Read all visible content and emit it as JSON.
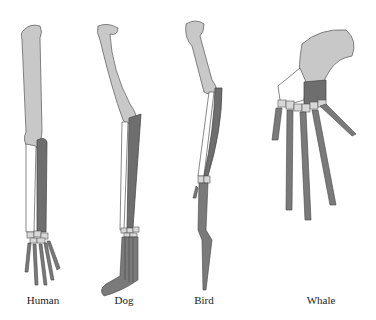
{
  "figure": {
    "labels": [
      "Human",
      "Dog",
      "Bird",
      "Whale"
    ],
    "colors": {
      "humerus": "#c8c8c8",
      "radius": "#6e6e6e",
      "ulna": "#ffffff",
      "carpals": "#d8d8d8",
      "digits": "#7a7a7a",
      "outline": "#555555"
    }
  }
}
